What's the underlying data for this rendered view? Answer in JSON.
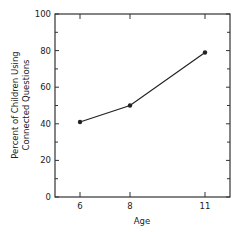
{
  "chart_data": {
    "type": "line",
    "title": "",
    "xlabel": "Age",
    "ylabel_lines": [
      "Percent of Children Using",
      "Connected Questions"
    ],
    "ylabel": "Percent of Children Using Connected Questions",
    "x": [
      6,
      8,
      11
    ],
    "series": [
      {
        "name": "Connected Questions",
        "values": [
          41,
          50,
          79
        ]
      }
    ],
    "xlim": [
      5,
      12
    ],
    "ylim": [
      0,
      100
    ],
    "x_ticks": [
      6,
      8,
      11
    ],
    "y_ticks": [
      0,
      20,
      40,
      60,
      80,
      100
    ],
    "y_minor_ticks": [
      10,
      30,
      50,
      70,
      90
    ],
    "grid": false,
    "legend": "none",
    "colors": {
      "line": "#222222",
      "axis": "#333333",
      "background": "#ffffff"
    }
  }
}
